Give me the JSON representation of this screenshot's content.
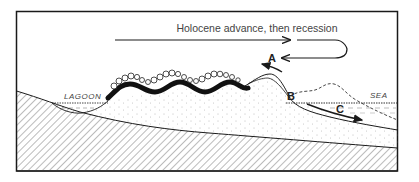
{
  "figure": {
    "title": "Holocene advance, then recession",
    "labels": {
      "lagoon": "LAGOON",
      "sea": "SEA",
      "point_a": "A",
      "point_b": "B",
      "point_c": "C"
    },
    "colors": {
      "ink": "#1a1a1a",
      "background": "#ffffff",
      "hatch": "#555555"
    }
  }
}
